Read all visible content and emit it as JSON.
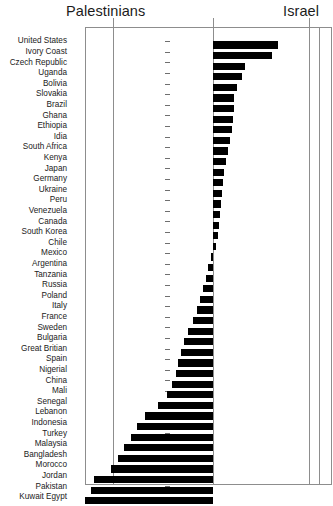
{
  "header": {
    "left_title": "Palestinians",
    "right_title": "Israel"
  },
  "chart_data": {
    "type": "bar",
    "orientation": "horizontal",
    "title": "",
    "subtitle": "",
    "xlabel": "",
    "ylabel": "",
    "axis_poles": [
      "Palestinians",
      "Israel"
    ],
    "legend": [],
    "grid": true,
    "gridlines_at": [
      -2,
      0,
      2
    ],
    "zero_at_px": 213,
    "xlim": [
      -2.6,
      2.35
    ],
    "note": "Diverging bar chart: positive values lean toward Israel (bars extend right), negative values lean toward Palestinians (bars extend left).",
    "categories": [
      "United States",
      "Ivory Coast",
      "Czech Republic",
      "Uganda",
      "Bolivia",
      "Slovakia",
      "Brazil",
      "Ghana",
      "Ethiopia",
      "Idia",
      "South Africa",
      "Kenya",
      "Japan",
      "Germany",
      "Ukraine",
      "Peru",
      "Venezuela",
      "Canada",
      "South Korea",
      "Chile",
      "Mexico",
      "Argentina",
      "Tanzania",
      "Russia",
      "Poland",
      "Italy",
      "France",
      "Sweden",
      "Bulgaria",
      "Great Britian",
      "Spain",
      "Nigerial",
      "China",
      "Mali",
      "Senegal",
      "Lebanon",
      "Indonesia",
      "Turkey",
      "Malaysia",
      "Bangladesh",
      "Morocco",
      "Jordan",
      "Pakistan",
      "Kuwait Egypt"
    ],
    "values": [
      1.3,
      1.18,
      0.64,
      0.58,
      0.48,
      0.42,
      0.42,
      0.4,
      0.38,
      0.34,
      0.3,
      0.26,
      0.22,
      0.2,
      0.18,
      0.16,
      0.14,
      0.12,
      0.1,
      0.06,
      -0.04,
      -0.1,
      -0.14,
      -0.2,
      -0.26,
      -0.32,
      -0.4,
      -0.5,
      -0.58,
      -0.64,
      -0.7,
      -0.74,
      -0.82,
      -0.92,
      -1.1,
      -1.36,
      -1.52,
      -1.64,
      -1.78,
      -1.9,
      -2.04,
      -2.38,
      -2.44,
      -2.56
    ]
  }
}
